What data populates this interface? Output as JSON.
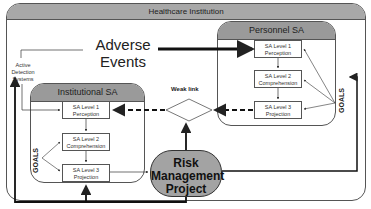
{
  "diagram": {
    "outer": {
      "title": "Healthcare Institution"
    },
    "adverse_events": {
      "label": "Adverse Events"
    },
    "active_detection": {
      "label": "Active Detection Systems"
    },
    "personnel_sa": {
      "title": "Personnel SA",
      "levels": [
        {
          "label": "SA Level 1",
          "sub": "Perception"
        },
        {
          "label": "SA Level 2",
          "sub": "Comprehension"
        },
        {
          "label": "SA Level 3",
          "sub": "Projection"
        }
      ],
      "goals": "GOALS"
    },
    "institutional_sa": {
      "title": "Institutional SA",
      "levels": [
        {
          "label": "SA Level 1",
          "sub": "Perception"
        },
        {
          "label": "SA Level 2",
          "sub": "Comprehension"
        },
        {
          "label": "SA Level 3",
          "sub": "Projection"
        }
      ],
      "goals": "GOALS"
    },
    "notification": {
      "label": "Notification"
    },
    "weak_link": {
      "label": "Weak link"
    },
    "risk_management": {
      "label_lines": [
        "Risk",
        "Management",
        "Project"
      ]
    },
    "colors": {
      "header_fill": "#a8a8a8",
      "rmp_fill": "#a3a3a3",
      "line": "#222222"
    }
  }
}
